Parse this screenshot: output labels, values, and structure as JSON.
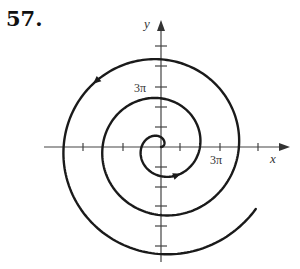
{
  "problem_number": "57.",
  "diagram": {
    "type": "polar-spiral",
    "equation_form": "r = θ (Archimedean spiral)",
    "direction": "counterclockwise",
    "axes": {
      "x_label": "x",
      "y_label": "y",
      "x_tick_label": "3π",
      "y_tick_label": "3π"
    },
    "colors": {
      "stroke": "#1a1a1a",
      "axis": "#444444"
    }
  }
}
